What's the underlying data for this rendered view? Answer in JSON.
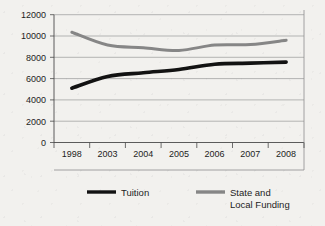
{
  "chart_data": {
    "type": "line",
    "title": "",
    "subtitle": "",
    "xlabel": "",
    "ylabel": "",
    "categories": [
      "1998",
      "2003",
      "2004",
      "2005",
      "2006",
      "2007",
      "2008"
    ],
    "series": [
      {
        "name": "Tuition",
        "color": "#121212",
        "values": [
          5100,
          6200,
          6550,
          6850,
          7350,
          7450,
          7550
        ]
      },
      {
        "name": "State and Local Funding",
        "color": "#868686",
        "values": [
          10350,
          9150,
          8900,
          8650,
          9150,
          9200,
          9600
        ]
      }
    ],
    "ylim": [
      0,
      12000
    ],
    "yticks": [
      0,
      2000,
      4000,
      6000,
      8000,
      10000,
      12000
    ],
    "ytick_labels": [
      "0",
      "2000",
      "4000",
      "6000",
      "8000",
      "10000",
      "12000"
    ],
    "grid": true,
    "grid_axis": "y",
    "legend_position": "bottom",
    "legend": [
      {
        "label": "Tuition",
        "label_line2": "",
        "color": "#121212"
      },
      {
        "label": "State and",
        "label_line2": "Local Funding",
        "color": "#868686"
      }
    ]
  },
  "axis": {
    "y_labels": [
      "12000",
      "10000",
      "8000",
      "6000",
      "4000",
      "2000",
      "0"
    ],
    "x_labels": [
      "1998",
      "2003",
      "2004",
      "2005",
      "2006",
      "2007",
      "2008"
    ]
  },
  "legend": {
    "item1_label": "Tuition",
    "item2_label_line1": "State and",
    "item2_label_line2": "Local Funding"
  },
  "colors": {
    "tuition": "#121212",
    "funding": "#868686",
    "grid": "#9a9a9a",
    "axis": "#4a4a4a",
    "background": "#f2f1ee"
  }
}
